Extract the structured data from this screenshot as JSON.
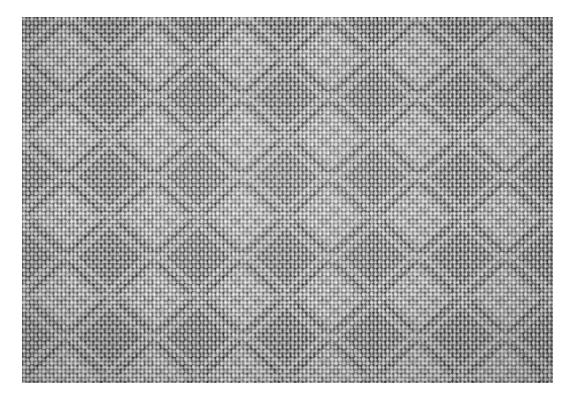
{
  "image": {
    "kind": "photograph",
    "subject": "woven-fabric-texture",
    "description": "Close-up grayscale macro photograph of a woven textile swatch showing a repeating diamond / diaper float pattern over a fine plain-weave ground",
    "color_mode": "grayscale",
    "alt_text": "Grey woven fabric close-up with repeating diamond lattice pattern",
    "caption": ""
  },
  "canvas": {
    "width": 577,
    "height": 401,
    "background_color": "#ffffff"
  },
  "swatch": {
    "x": 22,
    "y": 17,
    "width": 531,
    "height": 366,
    "border_color": "#ffffff",
    "mean_gray": "#8d8d8d"
  },
  "palette": {
    "paper_white": "#ffffff",
    "highlight": "#e8e8e8",
    "light_gray": "#c4c4c4",
    "mid_gray": "#8d8d8d",
    "dark_gray": "#5a5a5a",
    "shadow": "#2e2e2e"
  },
  "weave": {
    "structure": "plain weave ground with supplementary float blocks",
    "warp_pitch_px": 4.0,
    "weft_pitch_px": 4.05,
    "crossing_pitch_px": 8.1,
    "motif_period_x_px": 88,
    "motif_period_y_px": 80,
    "motif_columns": 6,
    "motif_rows": 4.6,
    "motif_shape": "diamond-lattice",
    "twill_drift_deg": 68
  },
  "chart_data": null
}
